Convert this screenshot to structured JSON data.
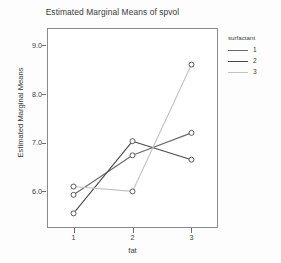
{
  "chart_data": {
    "type": "line",
    "title": "Estimated Marginal Means of spvol",
    "xlabel": "fat",
    "ylabel": "Estimated Marginal Means",
    "categories": [
      "1",
      "2",
      "3"
    ],
    "x": [
      1,
      2,
      3
    ],
    "xlim": [
      0.55,
      3.45
    ],
    "ylim": [
      5.25,
      9.35
    ],
    "yticks": [
      "6.0",
      "7.0",
      "8.0",
      "9.0"
    ],
    "ytick_values": [
      6.0,
      7.0,
      8.0,
      9.0
    ],
    "xticks": [
      "1",
      "2",
      "3"
    ],
    "grid": false,
    "legend_position": "right",
    "legend_title": "surfactant",
    "markers": "open-circle",
    "series": [
      {
        "name": "1",
        "values": [
          5.93,
          6.74,
          7.2
        ],
        "color": "#6a6a6a"
      },
      {
        "name": "2",
        "values": [
          5.55,
          7.03,
          6.65
        ],
        "color": "#4b4b4b"
      },
      {
        "name": "3",
        "values": [
          6.1,
          6.0,
          8.6
        ],
        "color": "#c2c2c2"
      }
    ]
  },
  "legend": {
    "title": "surfactant",
    "items": [
      {
        "label": "1",
        "color": "#6a6a6a"
      },
      {
        "label": "2",
        "color": "#4b4b4b"
      },
      {
        "label": "3",
        "color": "#c2c2c2"
      }
    ]
  },
  "axes": {
    "x_title": "fat",
    "y_title": "Estimated Marginal Means",
    "x_tick_labels": [
      "1",
      "2",
      "3"
    ],
    "y_tick_labels": [
      "9.0",
      "8.0",
      "7.0",
      "6.0"
    ]
  },
  "colors": {
    "frame": "#8b8b8b",
    "text": "#3b3b3b",
    "background": "#fdfdfd",
    "plot_background": "#ffffff",
    "series_1": "#6a6a6a",
    "series_2": "#4b4b4b",
    "series_3": "#c2c2c2"
  }
}
